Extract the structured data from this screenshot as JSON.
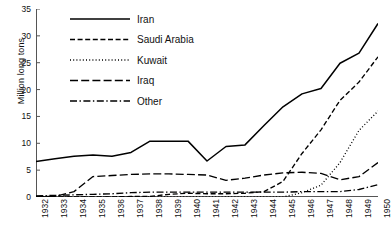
{
  "chart_data": {
    "type": "line",
    "title": "",
    "xlabel": "",
    "ylabel": "Million long tons",
    "xlim": [
      1932,
      1950
    ],
    "ylim": [
      0,
      35
    ],
    "yticks": [
      0,
      5,
      10,
      15,
      20,
      25,
      30,
      35
    ],
    "grid": false,
    "legend_position": "top-left",
    "x": [
      1932,
      1933,
      1934,
      1935,
      1936,
      1937,
      1938,
      1939,
      1940,
      1941,
      1942,
      1943,
      1944,
      1945,
      1946,
      1947,
      1948,
      1949,
      1950
    ],
    "categories": [
      "1932",
      "1933",
      "1934",
      "1935",
      "1936",
      "1937",
      "1938",
      "1939",
      "1940",
      "1941",
      "1942",
      "1943",
      "1944",
      "1945",
      "1946",
      "1947",
      "1948",
      "1949",
      "1950"
    ],
    "series": [
      {
        "name": "Iran",
        "style": "solid",
        "color": "#000000",
        "values": [
          6.6,
          7.1,
          7.6,
          7.8,
          7.6,
          8.3,
          10.4,
          10.4,
          10.4,
          6.7,
          9.4,
          9.7,
          13.3,
          16.8,
          19.2,
          20.2,
          24.9,
          26.8,
          32.3
        ]
      },
      {
        "name": "Saudi Arabia",
        "style": "dashed",
        "color": "#000000",
        "values": [
          0.0,
          0.0,
          0.0,
          0.0,
          0.0,
          0.1,
          0.1,
          0.5,
          0.7,
          0.6,
          0.6,
          0.7,
          1.0,
          2.9,
          8.1,
          12.5,
          18.0,
          21.4,
          26.1
        ]
      },
      {
        "name": "Kuwait",
        "style": "dotted",
        "color": "#000000",
        "values": [
          0.0,
          0.0,
          0.0,
          0.0,
          0.0,
          0.0,
          0.0,
          0.0,
          0.0,
          0.0,
          0.0,
          0.0,
          0.0,
          0.0,
          0.8,
          2.2,
          6.4,
          12.4,
          16.0
        ]
      },
      {
        "name": "Iraq",
        "style": "longdash",
        "color": "#000000",
        "values": [
          0.1,
          0.1,
          1.0,
          3.8,
          4.0,
          4.2,
          4.3,
          4.3,
          4.2,
          4.1,
          3.1,
          3.5,
          4.1,
          4.5,
          4.6,
          4.4,
          3.2,
          3.8,
          6.4
        ]
      },
      {
        "name": "Other",
        "style": "dashdot",
        "color": "#000000",
        "values": [
          0.2,
          0.3,
          0.4,
          0.5,
          0.6,
          0.8,
          0.9,
          0.9,
          0.9,
          0.9,
          0.9,
          0.9,
          0.9,
          0.9,
          1.0,
          1.0,
          1.0,
          1.4,
          2.3
        ]
      }
    ]
  },
  "legend": {
    "items": [
      {
        "label": "Iran",
        "style": "solid"
      },
      {
        "label": "Saudi Arabia",
        "style": "dashed"
      },
      {
        "label": "Kuwait",
        "style": "dotted"
      },
      {
        "label": "Iraq",
        "style": "longdash"
      },
      {
        "label": "Other",
        "style": "dashdot"
      }
    ]
  }
}
